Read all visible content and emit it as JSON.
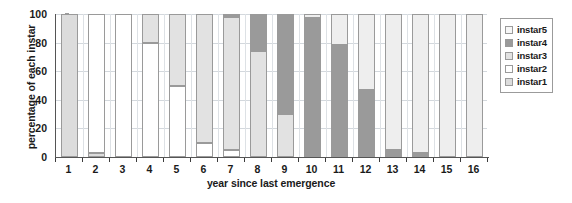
{
  "chart_data": {
    "type": "bar",
    "subtype": "stacked-percentage",
    "title": "",
    "xlabel": "year since last emergence",
    "ylabel": "percentage of each instar",
    "categories": [
      "1",
      "2",
      "3",
      "4",
      "5",
      "6",
      "7",
      "8",
      "9",
      "10",
      "11",
      "12",
      "13",
      "14",
      "15",
      "16"
    ],
    "ylim": [
      0,
      100
    ],
    "yticks": [
      0,
      20,
      40,
      60,
      80,
      100
    ],
    "grid": true,
    "legend_position": "right",
    "series": [
      {
        "name": "instar1",
        "color": "#dcdcdc",
        "values": [
          100,
          3,
          0,
          0,
          0,
          0,
          0,
          0,
          0,
          0,
          0,
          0,
          0,
          0,
          0,
          0
        ]
      },
      {
        "name": "instar2",
        "color": "#ffffff",
        "values": [
          0,
          97,
          100,
          80,
          50,
          10,
          5,
          0,
          0,
          0,
          0,
          0,
          0,
          0,
          0,
          0
        ]
      },
      {
        "name": "instar3",
        "color": "#e2e2e2",
        "values": [
          0,
          0,
          0,
          20,
          50,
          90,
          93,
          74,
          30,
          0,
          0,
          0,
          0,
          0,
          0,
          0
        ]
      },
      {
        "name": "instar4",
        "color": "#9a9a9a",
        "values": [
          0,
          0,
          0,
          0,
          0,
          0,
          2,
          26,
          70,
          97,
          78,
          47,
          5,
          3,
          0,
          0
        ]
      },
      {
        "name": "instar5",
        "color": "#eeeeee",
        "values": [
          0,
          0,
          0,
          0,
          0,
          0,
          0,
          0,
          0,
          3,
          22,
          53,
          95,
          97,
          100,
          100
        ]
      }
    ]
  },
  "legend": {
    "entries": [
      {
        "label": "instar5",
        "color": "#f7f7f7"
      },
      {
        "label": "instar4",
        "color": "#9a9a9a"
      },
      {
        "label": "instar3",
        "color": "#e2e2e2"
      },
      {
        "label": "instar2",
        "color": "#ffffff"
      },
      {
        "label": "instar1",
        "color": "#dcdcdc"
      }
    ]
  }
}
